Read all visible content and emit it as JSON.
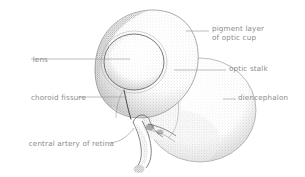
{
  "figure": {
    "background_color": "#ffffff",
    "ink_color": "#6f6f6f",
    "label_color": "#8b8b8b",
    "leader_color": "#9a9a9a",
    "technique": "stipple"
  },
  "labels": {
    "pigment_layer": {
      "line1": "pigment layer",
      "line2": "of optic cup"
    },
    "optic_stalk": "optic stalk",
    "diencephalon": "diencephalon",
    "lens": "lens",
    "choroid_fissure": "choroid fissure",
    "central_artery": "central artery of retina"
  },
  "structures": [
    {
      "name": "optic-cup",
      "label": "pigment layer of optic cup"
    },
    {
      "name": "lens",
      "label": "lens"
    },
    {
      "name": "choroid-fissure",
      "label": "choroid fissure"
    },
    {
      "name": "optic-stalk",
      "label": "optic stalk"
    },
    {
      "name": "diencephalon",
      "label": "diencephalon"
    },
    {
      "name": "central-artery-of-retina",
      "label": "central artery of retina"
    }
  ]
}
